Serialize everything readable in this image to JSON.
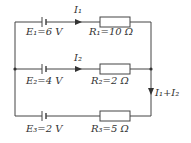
{
  "branches": [
    {
      "emf_label": "E₁=6 V",
      "resistor_label": "R₁=10 Ω",
      "current_label": "I₁"
    },
    {
      "emf_label": "E₂=4 V",
      "resistor_label": "R₂=2 Ω",
      "current_label": "I₂"
    },
    {
      "emf_label": "E₃=2 V",
      "resistor_label": "R₃=5 Ω"
    }
  ],
  "right_current_label": "I₁+I₂",
  "colors": {
    "wire": "#444444",
    "text": "#333333"
  }
}
